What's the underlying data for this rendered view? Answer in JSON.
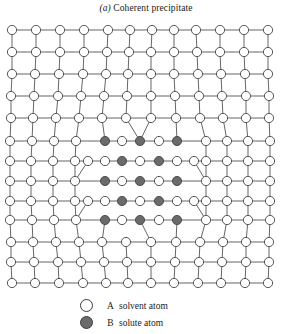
{
  "figure": {
    "label": "(a)",
    "caption": " Coherent precipitate"
  },
  "legend": {
    "items": [
      {
        "marker": "open-circle",
        "symbol": "A",
        "text": "solvent atom"
      },
      {
        "marker": "filled-circle",
        "symbol": "B",
        "text": "solute atom"
      }
    ]
  },
  "colors": {
    "solvent_fill": "#ffffff",
    "solute_fill": "#6b6b6b",
    "outline": "#3a3a3a",
    "bond": "#4a4a4a",
    "background": "#ffffff"
  },
  "lattice": {
    "description": "Two-dimensional square lattice of A solvent atoms containing a coherent B-rich precipitate; lattice planes are continuous across the interface and are elastically strained around the precipitate.",
    "rows": 13,
    "columns": 12,
    "atom_radius": 4.6,
    "precipitate": {
      "rows": 5,
      "columns": 5,
      "ordering": "alternating B and A atoms on a checkerboard arrangement",
      "corner_occupancy": "B solute atom"
    },
    "grid_rows": [
      {
        "y": 10,
        "x": [
          12,
          36,
          60,
          84,
          108,
          130,
          152,
          174,
          196,
          220,
          244,
          268
        ]
      },
      {
        "y": 32,
        "x": [
          12,
          36,
          60,
          84,
          107,
          129,
          151,
          174,
          197,
          220,
          244,
          268
        ]
      },
      {
        "y": 54,
        "x": [
          12,
          35,
          59,
          83,
          106,
          128,
          151,
          174,
          198,
          221,
          245,
          268
        ]
      },
      {
        "y": 76,
        "x": [
          11,
          34,
          58,
          81,
          104,
          127,
          151,
          175,
          199,
          222,
          246,
          269
        ]
      },
      {
        "y": 98,
        "x": [
          11,
          33,
          56,
          79,
          102,
          126,
          151,
          176,
          200,
          223,
          246,
          269
        ]
      },
      {
        "y": 121,
        "x": [
          10,
          32,
          54,
          76,
          105,
          140,
          177,
          206,
          227,
          248,
          270
        ]
      },
      {
        "y": 141,
        "x": [
          10,
          31,
          53,
          75,
          88,
          122,
          159,
          194,
          206,
          227,
          248,
          270
        ]
      },
      {
        "y": 161,
        "x": [
          10,
          31,
          53,
          75,
          105,
          140,
          177,
          206,
          227,
          248,
          270
        ]
      },
      {
        "y": 181,
        "x": [
          10,
          31,
          53,
          75,
          88,
          122,
          159,
          194,
          206,
          227,
          248,
          270
        ]
      },
      {
        "y": 200,
        "x": [
          10,
          32,
          54,
          76,
          105,
          140,
          177,
          206,
          227,
          248,
          270
        ]
      },
      {
        "y": 222,
        "x": [
          11,
          33,
          56,
          79,
          102,
          126,
          151,
          176,
          200,
          223,
          246,
          269
        ]
      },
      {
        "y": 242,
        "x": [
          11,
          34,
          58,
          81,
          104,
          127,
          151,
          175,
          199,
          222,
          246,
          269
        ]
      },
      {
        "y": 263,
        "x": [
          12,
          35,
          59,
          83,
          106,
          128,
          151,
          174,
          198,
          221,
          245,
          268
        ]
      }
    ],
    "precipitate_grid": {
      "columns_x": [
        105,
        122,
        140,
        159,
        177
      ],
      "rows_y": [
        121,
        141,
        161,
        181,
        200
      ],
      "occupancy": [
        [
          "B",
          "A",
          "B",
          "A",
          "B"
        ],
        [
          "A",
          "B",
          "A",
          "B",
          "A"
        ],
        [
          "B",
          "A",
          "B",
          "A",
          "B"
        ],
        [
          "A",
          "B",
          "A",
          "B",
          "A"
        ],
        [
          "B",
          "A",
          "B",
          "A",
          "B"
        ]
      ]
    }
  }
}
